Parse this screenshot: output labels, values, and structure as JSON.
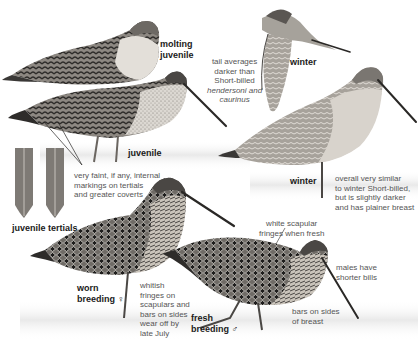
{
  "plate": {
    "subject": "Long-billed Dowitcher plumages",
    "figures": [
      {
        "id": "molting-juvenile",
        "label_lines": [
          "molting",
          "juvenile"
        ]
      },
      {
        "id": "juvenile",
        "label": "juvenile"
      },
      {
        "id": "winter-flight",
        "label": "winter"
      },
      {
        "id": "winter-standing",
        "label": "winter"
      },
      {
        "id": "juvenile-tertials",
        "label": "juvenile tertials"
      },
      {
        "id": "worn-breeding-female",
        "label_lines": [
          "worn",
          "breeding"
        ],
        "symbol": "♀"
      },
      {
        "id": "fresh-breeding-male",
        "label_lines": [
          "fresh",
          "breeding"
        ],
        "symbol": "♂"
      }
    ],
    "annotations": {
      "tail": {
        "lines": [
          "tail averages",
          "darker than",
          "Short-billed"
        ],
        "italic_lines": [
          "hendersoni and",
          "caurinus"
        ]
      },
      "tertials_note": {
        "lines": [
          "very faint, if any, internal",
          "markings on tertials",
          "and greater coverts"
        ]
      },
      "winter_note": {
        "lines": [
          "overall very similar",
          "to winter Short-billed,",
          "but is slightly darker",
          "and has plainer breast"
        ]
      },
      "scapular_note": {
        "lines": [
          "white scapular",
          "fringes when fresh"
        ]
      },
      "worn_note": {
        "lines": [
          "whitish",
          "fringes on",
          "scapulars and",
          "bars on sides",
          "wear off by",
          "late July"
        ]
      },
      "males_note": {
        "lines": [
          "males have",
          "shorter bills"
        ]
      },
      "bars_note": {
        "lines": [
          "bars on sides",
          "of breast"
        ]
      }
    },
    "colors": {
      "background": "#ffffff",
      "water": "#ececec",
      "plumage_dark": "#3a3836",
      "plumage_mid": "#8a8680",
      "plumage_light": "#cfcac3",
      "label_text": "#1a1a1a",
      "note_text": "#555555"
    }
  }
}
